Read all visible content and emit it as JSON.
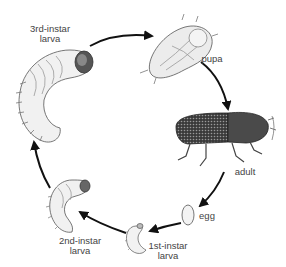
{
  "diagram": {
    "type": "life-cycle",
    "stages": [
      {
        "id": "egg",
        "lines": [
          "egg"
        ]
      },
      {
        "id": "first-instar",
        "lines": [
          "1st-instar",
          "larva"
        ]
      },
      {
        "id": "second-instar",
        "lines": [
          "2nd-instar",
          "larva"
        ]
      },
      {
        "id": "third-instar",
        "lines": [
          "3rd-instar",
          "larva"
        ]
      },
      {
        "id": "pupa",
        "lines": [
          "pupa"
        ]
      },
      {
        "id": "adult",
        "lines": [
          "adult"
        ]
      }
    ],
    "arrows": [
      {
        "from": "third-instar",
        "to": "pupa"
      },
      {
        "from": "pupa",
        "to": "adult"
      },
      {
        "from": "adult",
        "to": "egg"
      },
      {
        "from": "egg",
        "to": "first-instar"
      },
      {
        "from": "first-instar",
        "to": "second-instar"
      },
      {
        "from": "second-instar",
        "to": "third-instar"
      }
    ],
    "colors": {
      "background": "#ffffff",
      "arrow": "#111111",
      "label": "#444444",
      "ink": "#333333"
    }
  }
}
